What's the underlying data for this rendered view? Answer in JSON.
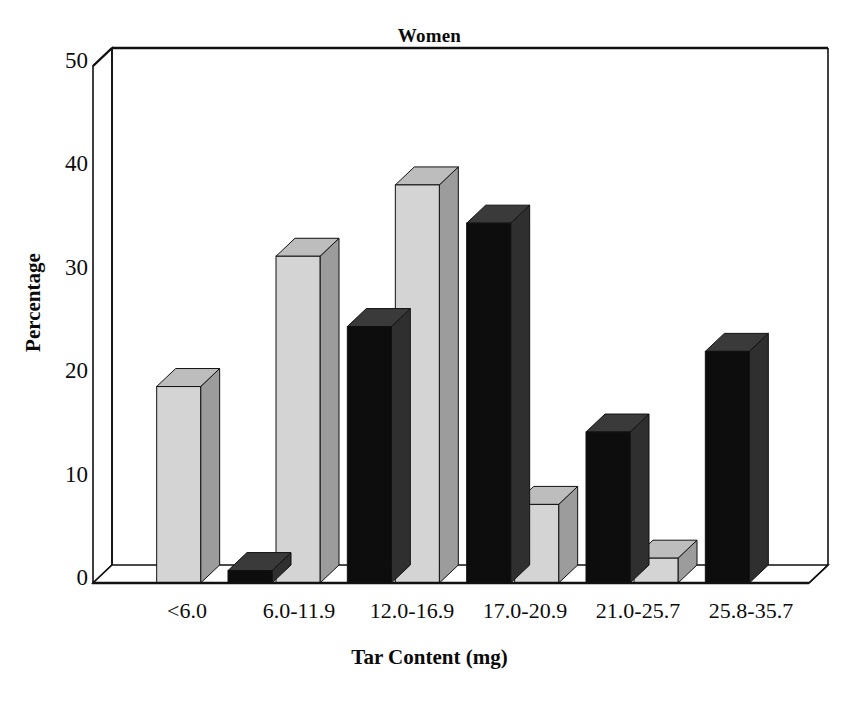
{
  "chart_data": {
    "type": "bar",
    "title": "Women",
    "xlabel": "Tar Content (mg)",
    "ylabel": "Percentage",
    "categories": [
      "<6.0",
      "6.0-11.9",
      "12.0-16.9",
      "17.0-20.9",
      "21.0-25.7",
      "25.8-35.7"
    ],
    "series": [
      {
        "name": "CPS-I",
        "color": "#0d0d0d",
        "values": [
          0,
          1.2,
          24.8,
          34.8,
          14.6,
          22.4
        ]
      },
      {
        "name": "CPS-II",
        "color": "#d2d2d2",
        "values": [
          19.0,
          31.6,
          38.5,
          7.6,
          2.4,
          0
        ]
      }
    ],
    "ylim": [
      0,
      50
    ],
    "yticks": [
      0,
      10,
      20,
      30,
      40,
      50
    ],
    "grid": true,
    "legend_position": "top-left",
    "style": "3d-columns"
  },
  "legend": {
    "items": [
      {
        "label": "CPS-I",
        "swatch": "black-swatch"
      },
      {
        "label": "CPS-II",
        "swatch": "gray-swatch"
      }
    ]
  },
  "axes": {
    "y_tick_labels": [
      "50",
      "40",
      "30",
      "20",
      "10",
      "0"
    ],
    "x_tick_labels": [
      "<6.0",
      "6.0-11.9",
      "12.0-16.9",
      "17.0-20.9",
      "21.0-25.7",
      "25.8-35.7"
    ],
    "y_title": "Percentage",
    "x_title": "Tar Content (mg)"
  },
  "colors": {
    "series_cps1": "#0d0d0d",
    "series_cps2": "#d2d2d2",
    "series_cps1_side": "#2b2b2b",
    "series_cps2_side": "#9a9a9a",
    "axis_line": "#111111",
    "gridline": "#b9b9b9",
    "background": "#ffffff"
  }
}
